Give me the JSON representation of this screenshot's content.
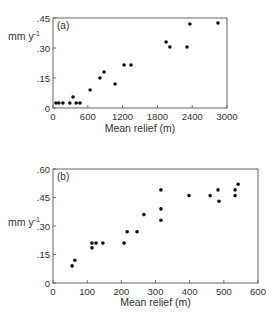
{
  "chart_data": [
    {
      "type": "scatter",
      "panel": "(a)",
      "title": "",
      "xlabel": "Mean relief (m)",
      "ylabel": "mm y-1",
      "xlim": [
        0,
        3000
      ],
      "ylim": [
        0,
        0.45
      ],
      "xticks": [
        0,
        600,
        1200,
        1800,
        2400,
        3000
      ],
      "xtick_labels": [
        "0",
        "600",
        "1200",
        "1800",
        "2400",
        "3000"
      ],
      "yticks": [
        0,
        0.15,
        0.3,
        0.45
      ],
      "ytick_labels": [
        "0",
        ".15",
        ".30",
        ".45"
      ],
      "grid": false,
      "legend": null,
      "points": [
        {
          "x": 50,
          "y": 0.025
        },
        {
          "x": 100,
          "y": 0.025
        },
        {
          "x": 170,
          "y": 0.025
        },
        {
          "x": 290,
          "y": 0.025
        },
        {
          "x": 345,
          "y": 0.055
        },
        {
          "x": 400,
          "y": 0.025
        },
        {
          "x": 465,
          "y": 0.025
        },
        {
          "x": 640,
          "y": 0.09
        },
        {
          "x": 810,
          "y": 0.15
        },
        {
          "x": 880,
          "y": 0.18
        },
        {
          "x": 1070,
          "y": 0.12
        },
        {
          "x": 1225,
          "y": 0.215
        },
        {
          "x": 1345,
          "y": 0.215
        },
        {
          "x": 1950,
          "y": 0.33
        },
        {
          "x": 2015,
          "y": 0.305
        },
        {
          "x": 2310,
          "y": 0.305
        },
        {
          "x": 2360,
          "y": 0.42
        },
        {
          "x": 2845,
          "y": 0.425
        }
      ]
    },
    {
      "type": "scatter",
      "panel": "(b)",
      "title": "",
      "xlabel": "Mean relief (m)",
      "ylabel": "mm y-1",
      "xlim": [
        0,
        600
      ],
      "ylim": [
        0,
        0.6
      ],
      "xticks": [
        0,
        100,
        200,
        300,
        400,
        500,
        600
      ],
      "xtick_labels": [
        "0",
        "100",
        "200",
        "300",
        "400",
        "500",
        "600"
      ],
      "yticks": [
        0,
        0.15,
        0.3,
        0.45,
        0.6
      ],
      "ytick_labels": [
        "0",
        ".15",
        ".30",
        ".45",
        ".60"
      ],
      "grid": false,
      "legend": null,
      "points": [
        {
          "x": 56,
          "y": 0.09
        },
        {
          "x": 64,
          "y": 0.12
        },
        {
          "x": 114,
          "y": 0.21
        },
        {
          "x": 114,
          "y": 0.185
        },
        {
          "x": 126,
          "y": 0.21
        },
        {
          "x": 146,
          "y": 0.21
        },
        {
          "x": 208,
          "y": 0.21
        },
        {
          "x": 217,
          "y": 0.27
        },
        {
          "x": 246,
          "y": 0.27
        },
        {
          "x": 266,
          "y": 0.36
        },
        {
          "x": 316,
          "y": 0.49
        },
        {
          "x": 316,
          "y": 0.39
        },
        {
          "x": 316,
          "y": 0.33
        },
        {
          "x": 398,
          "y": 0.46
        },
        {
          "x": 460,
          "y": 0.46
        },
        {
          "x": 483,
          "y": 0.49
        },
        {
          "x": 486,
          "y": 0.43
        },
        {
          "x": 533,
          "y": 0.49
        },
        {
          "x": 533,
          "y": 0.46
        },
        {
          "x": 542,
          "y": 0.52
        }
      ]
    }
  ],
  "style": {
    "point_color": "#111111",
    "axis_color": "#555555"
  }
}
